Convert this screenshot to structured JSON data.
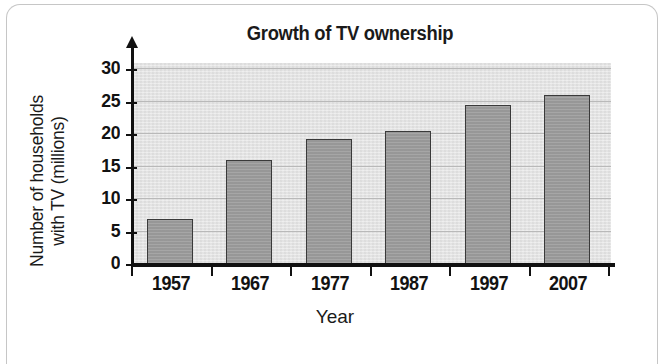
{
  "chart_data": {
    "type": "bar",
    "title": "Growth of TV ownership",
    "xlabel": "Year",
    "ylabel": "Number of households with TV (millions)",
    "ylabel_lines": [
      "Number of households",
      "with TV (millions)"
    ],
    "categories": [
      "1957",
      "1967",
      "1977",
      "1987",
      "1997",
      "2007"
    ],
    "values": [
      7,
      16,
      19.3,
      20.5,
      24.5,
      26
    ],
    "ylim": [
      0,
      31
    ],
    "yticks": [
      0,
      5,
      10,
      15,
      20,
      25,
      30
    ],
    "ytick_labels": [
      "0",
      "5",
      "10",
      "15",
      "20",
      "25",
      "30"
    ],
    "grid": true,
    "legend": false,
    "bar_color": "#9c9c9c",
    "bar_edge_color": "#3a3a3a",
    "plot_background": "#e3e3e3",
    "gridline_color": "#b9b9b9",
    "axis_color": "#111111",
    "text_color": "#121212"
  }
}
